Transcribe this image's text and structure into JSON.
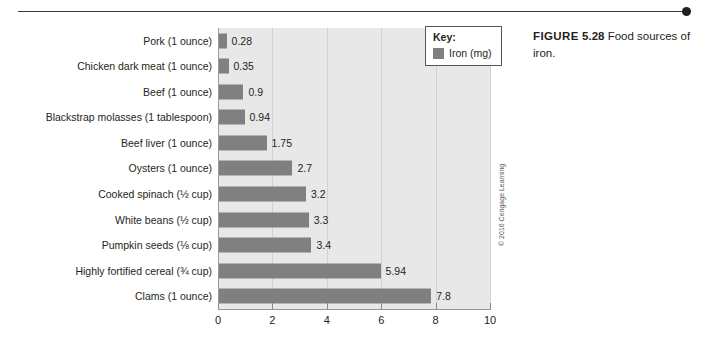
{
  "caption": {
    "figure_word": "FIGURE",
    "figure_number": "5.28",
    "text": "Food sources of iron."
  },
  "legend": {
    "title": "Key:",
    "entries": [
      {
        "label": "Iron (mg)",
        "color": "#808080"
      }
    ]
  },
  "credit": "© 2016 Cengage Learning",
  "colors": {
    "bar": "#808080",
    "plot_background": "#e8e8e8",
    "gridline": "#d2d2d2",
    "axis": "#9a9a9a",
    "text": "#231f20"
  },
  "chart_data": {
    "type": "bar",
    "orientation": "horizontal",
    "title": "Food sources of iron.",
    "xlabel": "",
    "ylabel": "",
    "xlim": [
      0,
      10
    ],
    "xticks": [
      "0",
      "2",
      "4",
      "6",
      "8",
      "10"
    ],
    "xtick_values": [
      0,
      2,
      4,
      6,
      8,
      10
    ],
    "grid": true,
    "grid_axis": "x",
    "legend_position": "top-right",
    "series": [
      {
        "name": "Iron (mg)",
        "color": "#808080",
        "values": [
          0.28,
          0.35,
          0.9,
          0.94,
          1.75,
          2.7,
          3.2,
          3.3,
          3.4,
          5.94,
          7.8
        ]
      }
    ],
    "categories": [
      "Pork (1 ounce)",
      "Chicken dark meat (1 ounce)",
      "Beef (1 ounce)",
      "Blackstrap molasses (1 tablespoon)",
      "Beef liver (1 ounce)",
      "Oysters (1 ounce)",
      "Cooked spinach (½ cup)",
      "White beans (½ cup)",
      "Pumpkin seeds (⅛ cup)",
      "Highly fortified cereal (¾ cup)",
      "Clams (1 ounce)"
    ],
    "data_labels": [
      "0.28",
      "0.35",
      "0.9",
      "0.94",
      "1.75",
      "2.7",
      "3.2",
      "3.3",
      "3.4",
      "5.94",
      "7.8"
    ],
    "rows": [
      {
        "label": "Pork (1 ounce)",
        "value": 0.28,
        "value_label": "0.28"
      },
      {
        "label": "Chicken dark meat (1 ounce)",
        "value": 0.35,
        "value_label": "0.35"
      },
      {
        "label": "Beef (1 ounce)",
        "value": 0.9,
        "value_label": "0.9"
      },
      {
        "label": "Blackstrap molasses (1 tablespoon)",
        "value": 0.94,
        "value_label": "0.94"
      },
      {
        "label": "Beef liver (1 ounce)",
        "value": 1.75,
        "value_label": "1.75"
      },
      {
        "label": "Oysters (1 ounce)",
        "value": 2.7,
        "value_label": "2.7"
      },
      {
        "label": "Cooked spinach (½ cup)",
        "value": 3.2,
        "value_label": "3.2"
      },
      {
        "label": "White beans (½ cup)",
        "value": 3.3,
        "value_label": "3.3"
      },
      {
        "label": "Pumpkin seeds (⅛ cup)",
        "value": 3.4,
        "value_label": "3.4"
      },
      {
        "label": "Highly fortified cereal (¾ cup)",
        "value": 5.94,
        "value_label": "5.94"
      },
      {
        "label": "Clams (1 ounce)",
        "value": 7.8,
        "value_label": "7.8"
      }
    ]
  }
}
